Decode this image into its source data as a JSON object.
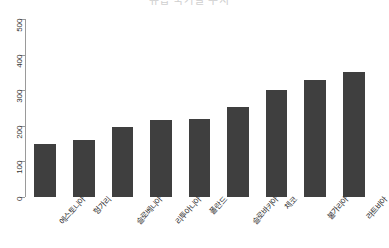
{
  "chart_data": {
    "type": "bar",
    "title": "유럽 국가별 수치",
    "xlabel": "",
    "ylabel": "",
    "categories": [
      "에스토니아",
      "헝가리",
      "슬로베니아",
      "리투아니아",
      "폴란드",
      "슬로바키아",
      "체코",
      "불가리아",
      "라트비아"
    ],
    "values": [
      148,
      160,
      197,
      215,
      220,
      252,
      300,
      330,
      350
    ],
    "ylim": [
      0,
      500
    ],
    "yticks": [
      0,
      100,
      200,
      300,
      400,
      500
    ],
    "ytick_labels": [
      "0",
      "100",
      "200",
      "300",
      "400",
      "500"
    ],
    "grid": false,
    "legend": false,
    "bar_color": "#3f3f3f",
    "axis_color": "#9a9a9a",
    "background_color": "#ffffff"
  }
}
